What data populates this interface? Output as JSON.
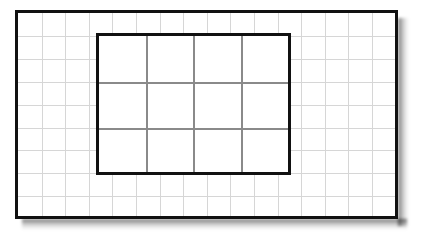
{
  "figure": {
    "background_color": "#ffffff",
    "canvas": {
      "width": 423,
      "height": 237
    }
  },
  "outer_rectangle": {
    "name": "outer-rectangle",
    "border_color": "#111111",
    "border_width_px": 3,
    "fill_color": "#ffffff",
    "x": 15,
    "y": 10,
    "width": 383,
    "height": 209,
    "grid": {
      "line_color": "#d6d6d6",
      "line_width_px": 1,
      "columns": 16,
      "rows": 9,
      "cell_width_px": 23.6,
      "cell_height_px": 22.9,
      "vertical_line_offsets": [
        23.6,
        47.2,
        70.8,
        94.4,
        118.0,
        141.6,
        165.2,
        188.8,
        212.4,
        236.0,
        259.6,
        283.2,
        306.8,
        330.4,
        354.0
      ],
      "horizontal_line_offsets": [
        22.9,
        45.8,
        68.7,
        91.6,
        114.5,
        137.4,
        160.3,
        183.2
      ]
    }
  },
  "inner_rectangle": {
    "name": "inner-rectangle",
    "border_color": "#111111",
    "border_width_px": 3,
    "fill_color": "#ffffff",
    "x": 96,
    "y": 33,
    "width": 195,
    "height": 142,
    "spans_outer_cells": {
      "columns": 8,
      "rows": 6
    },
    "grid": {
      "line_color": "#8a8a8a",
      "line_width_px": 2,
      "columns": 4,
      "rows": 3,
      "cell_width_px": 47.2,
      "cell_height_px": 45.8,
      "vertical_line_offsets": [
        47.2,
        94.4,
        141.6
      ],
      "horizontal_line_offsets": [
        45.8,
        91.6
      ]
    }
  },
  "shadow": {
    "name": "drop-shadow",
    "color": "rgba(0,0,0,0.55)",
    "sides": [
      "right",
      "bottom"
    ],
    "spread_px": 11
  }
}
